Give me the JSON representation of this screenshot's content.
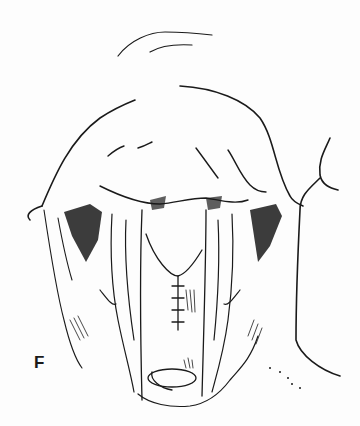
{
  "figure": {
    "panel_label": "F",
    "ink_color": "#1a1a1a",
    "background": "#fdfdfd"
  }
}
